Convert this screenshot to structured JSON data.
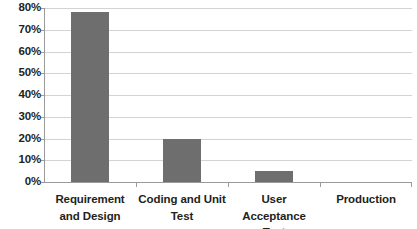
{
  "chart_data": {
    "type": "bar",
    "title": "",
    "subtitle": "",
    "xlabel": "",
    "ylabel": "",
    "categories": [
      "Requirement and Design",
      "Coding and Unit Test",
      "User Acceptance Test",
      "Production"
    ],
    "values": [
      78,
      20,
      5,
      0
    ],
    "ylim": [
      0,
      80
    ],
    "ytick_labels": [
      "80%",
      "70%",
      "60%",
      "50%",
      "40%",
      "30%",
      "20%",
      "10%",
      "0%"
    ],
    "ytick_values": [
      80,
      70,
      60,
      50,
      40,
      30,
      20,
      10,
      0
    ],
    "value_format": "percent",
    "grid": true,
    "grid_axis": "y",
    "legend": false,
    "legend_position": "none",
    "series": [
      {
        "name": "",
        "values": [
          78,
          20,
          5,
          0
        ]
      }
    ],
    "colors": {
      "bar": "#6e6e6e",
      "gridline": "#d3d3d3",
      "axis": "#9a9a9a",
      "text": "#231f20",
      "background": "#ffffff"
    }
  }
}
